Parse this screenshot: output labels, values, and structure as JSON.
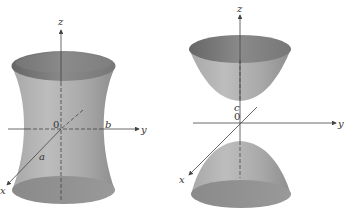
{
  "figures": [
    {
      "name": "hyperboloid-one-sheet",
      "axes": {
        "x": "x",
        "y": "y",
        "z": "z"
      },
      "origin": "0",
      "annotations": [
        "a",
        "b"
      ]
    },
    {
      "name": "hyperboloid-two-sheets",
      "axes": {
        "x": "x",
        "y": "y",
        "z": "z"
      },
      "origin": "0",
      "annotations": [
        "c"
      ]
    }
  ],
  "colors": {
    "surface": "#9a9a9a",
    "surface_light": "#b5b5b5",
    "rim": "#6e6e6e",
    "axis": "#444444"
  }
}
